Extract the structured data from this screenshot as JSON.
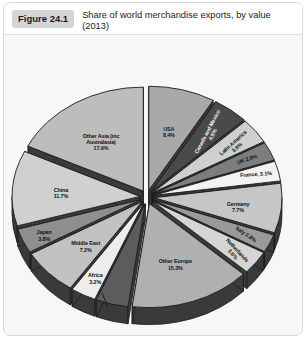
{
  "header": {
    "figure_badge": "Figure 24.1",
    "title": "Share of world merchandise exports, by value (2013)"
  },
  "chart_data": {
    "type": "pie",
    "title": "Share of world merchandise exports, by value (2013)",
    "subtitle": "",
    "xlabel": "",
    "ylabel": "",
    "units": "percent",
    "exploded": true,
    "three_d": true,
    "legend": "none",
    "grid": false,
    "start_angle_deg": 0,
    "direction": "clockwise",
    "labels": [
      "USA",
      "Canada and Mexico",
      "Latin America",
      "UK",
      "France",
      "Germany",
      "Italy",
      "Netherlands",
      "Other Europe",
      "CIS (former Soviet republics)",
      "Africa",
      "Middle East",
      "Japan",
      "China",
      "Other Asia (inc Australasia)"
    ],
    "values": [
      8.4,
      4.5,
      3.9,
      2.9,
      3.1,
      7.7,
      2.8,
      3.6,
      15.3,
      4.1,
      3.2,
      7.2,
      3.8,
      11.7,
      17.9
    ],
    "slices": [
      {
        "label": "USA",
        "value": 8.4,
        "display": "USA\n8.4%",
        "color": "#a9a9a9"
      },
      {
        "label": "Canada and Mexico",
        "value": 4.5,
        "display": "Canada and Mexico\n4.5%",
        "color": "#4a4a4a"
      },
      {
        "label": "Latin America",
        "value": 3.9,
        "display": "Latin America\n3.9%",
        "color": "#cfcfcf"
      },
      {
        "label": "UK",
        "value": 2.9,
        "display": "UK 2.9%",
        "color": "#7d7d7d"
      },
      {
        "label": "France",
        "value": 3.1,
        "display": "France, 3.1%",
        "color": "#f2f2f2"
      },
      {
        "label": "Germany",
        "value": 7.7,
        "display": "Germany\n7.7%",
        "color": "#c6c6c6"
      },
      {
        "label": "Italy",
        "value": 2.8,
        "display": "Italy 2.8%",
        "color": "#9a9a9a"
      },
      {
        "label": "Netherlands",
        "value": 3.6,
        "display": "Netherlands\n3.6%",
        "color": "#d5d5d5"
      },
      {
        "label": "Other Europe",
        "value": 15.3,
        "display": "Other Europe\n15.3%",
        "color": "#b0b0b0"
      },
      {
        "label": "CIS (former Soviet republics)",
        "value": 4.1,
        "display": "CIS (former Soviet\nrepublics)\n4.1%",
        "color": "#5c5c5c"
      },
      {
        "label": "Africa",
        "value": 3.2,
        "display": "Africa\n3.2%",
        "color": "#ededed"
      },
      {
        "label": "Middle East",
        "value": 7.2,
        "display": "Middle East\n7.2%",
        "color": "#c2c2c2"
      },
      {
        "label": "Japan",
        "value": 3.8,
        "display": "Japan\n3.8%",
        "color": "#8f8f8f"
      },
      {
        "label": "China",
        "value": 11.7,
        "display": "China\n11.7%",
        "color": "#d0d0d0"
      },
      {
        "label": "Other Asia (inc Australasia)",
        "value": 17.9,
        "display": "Other Asia (inc\nAustralasia)\n17.9%",
        "color": "#bdbdbd"
      }
    ],
    "colors": {
      "panel_background": "#f7f7f5",
      "side_dark": "#3a3a3a",
      "outline": "#1c1c1c",
      "label_text": "#111111"
    }
  }
}
